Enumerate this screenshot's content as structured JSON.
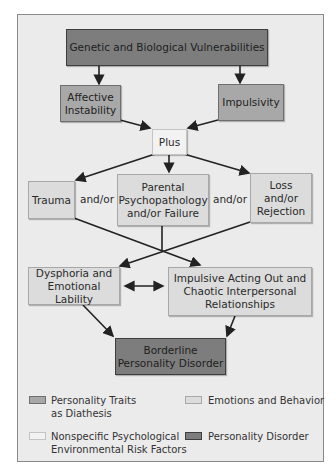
{
  "diagram": {
    "nodes": {
      "genetic": "Genetic and Biological Vulnerabilities",
      "affective": "Affective Instability",
      "impulsivity": "Impulsivity",
      "plus": "Plus",
      "trauma": "Trauma",
      "parental": "Parental Psychopathology and/or Failure",
      "loss": "Loss and/or Rejection",
      "dysphoria": "Dysphoria and Emotional Lability",
      "impulsive_acting": "Impulsive Acting Out and Chaotic Interpersonal Relationships",
      "borderline": "Borderline Personality Disorder"
    },
    "connectors": {
      "andor_left": "and/or",
      "andor_right": "and/or"
    },
    "edges": [
      {
        "from": "genetic",
        "to": "affective"
      },
      {
        "from": "genetic",
        "to": "impulsivity"
      },
      {
        "from": "affective",
        "to": "plus"
      },
      {
        "from": "impulsivity",
        "to": "plus"
      },
      {
        "from": "plus",
        "to": "trauma"
      },
      {
        "from": "plus",
        "to": "parental"
      },
      {
        "from": "plus",
        "to": "loss"
      },
      {
        "from": "trauma",
        "to": "impulsive_acting"
      },
      {
        "from": "loss",
        "to": "dysphoria"
      },
      {
        "from": "parental",
        "to": "crossing"
      },
      {
        "from": "dysphoria",
        "to": "impulsive_acting",
        "bidirectional": true
      },
      {
        "from": "dysphoria",
        "to": "borderline"
      },
      {
        "from": "impulsive_acting",
        "to": "borderline"
      }
    ]
  },
  "legend": {
    "items": [
      {
        "label": "Personality Traits as Diathesis",
        "color": "#a8a8a8"
      },
      {
        "label": "Emotions and Behavior",
        "color": "#dcdcdc"
      },
      {
        "label": "Nonspecific Psychological Environmental Risk Factors",
        "color": "#f0f0f0"
      },
      {
        "label": "Personality Disorder",
        "color": "#7d7d7d"
      }
    ],
    "line1": {
      "traits_a": "Personality Traits",
      "traits_b": "as Diathesis",
      "emotions": "Emotions and Behavior"
    },
    "line2": {
      "nonspecific_a": "Nonspecific Psychological",
      "nonspecific_b": "Environmental Risk Factors",
      "disorder": "Personality Disorder"
    }
  },
  "colors": {
    "dark": "#7d7d7d",
    "mid": "#a8a8a8",
    "light": "#dcdcdc",
    "pale": "#f2f2f2",
    "background": "#ebebeb"
  }
}
